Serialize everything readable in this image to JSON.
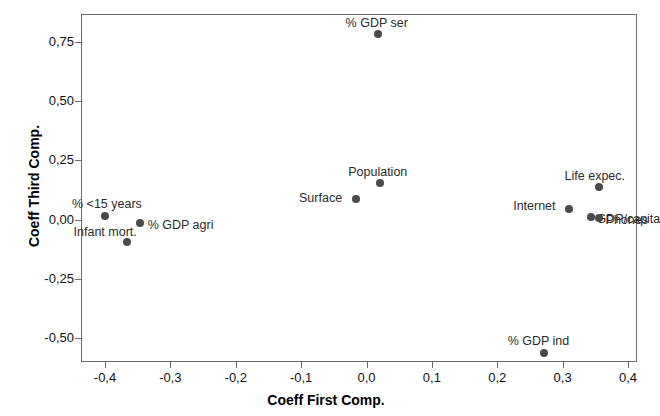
{
  "chart_data": {
    "type": "scatter",
    "title": "",
    "xlabel": "Coeff First Comp.",
    "ylabel": "Coeff Third Comp.",
    "xlim": [
      -0.437,
      0.414
    ],
    "ylim": [
      -0.562,
      0.869
    ],
    "grid": false,
    "legend": "none",
    "decimal_separator": ",",
    "xticks": [
      "-0,4",
      "-0,3",
      "-0,2",
      "-0,1",
      "0,0",
      "0,1",
      "0,2",
      "0,3",
      "0,4"
    ],
    "xtick_values": [
      -0.4,
      -0.3,
      -0.2,
      -0.1,
      0.0,
      0.1,
      0.2,
      0.3,
      0.4
    ],
    "yticks": [
      "0,75",
      "0,50",
      "0,25",
      "0,00",
      "-0,25",
      "-0,50"
    ],
    "ytick_values": [
      0.75,
      0.5,
      0.25,
      0.0,
      -0.25,
      -0.5
    ],
    "marker_color": "#4a4a4a",
    "frame_color": "#6b6b6b",
    "points": [
      {
        "label": "% GDP ser",
        "x": 0.017,
        "y": 0.783,
        "label_dx": -32,
        "label_dy": -17
      },
      {
        "label": "Population",
        "x": 0.021,
        "y": 0.155,
        "label_dx": -32,
        "label_dy": -17
      },
      {
        "label": "Surface",
        "x": -0.016,
        "y": 0.088,
        "label_dx": -57,
        "label_dy": -7
      },
      {
        "label": "Life expec.",
        "x": 0.355,
        "y": 0.137,
        "label_dx": -34,
        "label_dy": -17
      },
      {
        "label": "Internet",
        "x": 0.31,
        "y": 0.045,
        "label_dx": -56,
        "label_dy": -9
      },
      {
        "label": "GDP/capita",
        "x": 0.344,
        "y": 0.009,
        "label_dx": 5,
        "label_dy": -4
      },
      {
        "label": "Phones",
        "x": 0.355,
        "y": 0.005,
        "label_dx": 7,
        "label_dy": -4
      },
      {
        "label": "% <15 years",
        "x": -0.4,
        "y": 0.017,
        "label_dx": -33,
        "label_dy": -18
      },
      {
        "label": "% GDP agri",
        "x": -0.347,
        "y": -0.013,
        "label_dx": 8,
        "label_dy": -4
      },
      {
        "label": "Infant mort.",
        "x": -0.367,
        "y": -0.095,
        "label_dx": -53,
        "label_dy": -16
      },
      {
        "label": "% GDP ind",
        "x": 0.271,
        "y": -0.563,
        "label_dx": -36,
        "label_dy": -18
      }
    ]
  }
}
